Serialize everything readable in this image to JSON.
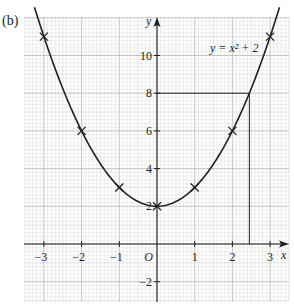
{
  "part_label": "(b)",
  "chart_data": {
    "type": "line",
    "title": "",
    "equation_label": "y = x² + 2",
    "xlabel": "x",
    "ylabel": "y",
    "origin_label": "O",
    "xlim": [
      -3.5,
      3.5
    ],
    "ylim": [
      -3,
      12
    ],
    "x_ticks": [
      -3,
      -2,
      -1,
      1,
      2,
      3
    ],
    "x_tick_labels": [
      "−3",
      "−2",
      "−1",
      "1",
      "2",
      "3"
    ],
    "y_ticks": [
      -2,
      2,
      4,
      6,
      8,
      10
    ],
    "y_tick_labels": [
      "−2",
      "2",
      "4",
      "6",
      "8",
      "10"
    ],
    "grid": true,
    "series": [
      {
        "name": "y = x² + 2",
        "function": "x^2 + 2",
        "x_range": [
          -3.25,
          3.25
        ],
        "color": "#231f20"
      }
    ],
    "plotted_points": {
      "x": [
        -3,
        -2,
        -1,
        0,
        1,
        2,
        3
      ],
      "y": [
        11,
        6,
        3,
        2,
        3,
        6,
        11
      ],
      "marker": "x"
    },
    "annotations": [
      {
        "type": "reading-lines",
        "description": "Horizontal line at y = 8 from the y-axis to the curve, then vertical line down to the x-axis",
        "y": 8,
        "x": 2.45
      }
    ]
  },
  "colors": {
    "ink": "#231f20",
    "grid_minor": "#dcdcdc",
    "grid_major": "#b4b4b4"
  }
}
